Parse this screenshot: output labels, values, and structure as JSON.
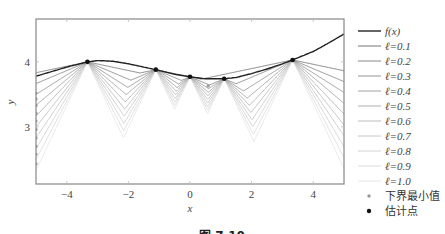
{
  "chart_data": {
    "type": "line",
    "title": "",
    "xlabel": "x",
    "ylabel": "y",
    "xlim": [
      -5,
      5
    ],
    "ylim": [
      2.12,
      4.66
    ],
    "xticks": [
      -4,
      -2,
      0,
      2,
      4
    ],
    "xtick_labels": [
      "−4",
      "−2",
      "0",
      "2",
      "4"
    ],
    "yticks": [
      3,
      4
    ],
    "ytick_labels": [
      "3",
      "4"
    ],
    "grid": false,
    "legend_position": "right",
    "f": {
      "name": "f(x)",
      "color": "#222222",
      "x": [
        -5,
        -4.5,
        -4,
        -3.33,
        -3,
        -2.5,
        -2,
        -1.5,
        -1.11,
        -0.5,
        0,
        0.5,
        1.11,
        1.5,
        2,
        2.5,
        3,
        3.33,
        4,
        4.5,
        5
      ],
      "y": [
        3.78,
        3.85,
        3.92,
        4.0,
        4.02,
        4.01,
        3.97,
        3.92,
        3.88,
        3.81,
        3.77,
        3.74,
        3.74,
        3.76,
        3.82,
        3.89,
        3.97,
        4.03,
        4.16,
        4.29,
        4.43
      ]
    },
    "estimate_points": {
      "name": "估计点",
      "x": [
        -3.33,
        -1.11,
        0,
        1.11,
        3.33
      ],
      "y": [
        4.0,
        3.88,
        3.77,
        3.74,
        4.03
      ]
    },
    "lipschitz_series": [
      {
        "name": "ℓ=0.1",
        "l": 0.1,
        "color": "#777777"
      },
      {
        "name": "ℓ=0.2",
        "l": 0.2,
        "color": "#888888"
      },
      {
        "name": "ℓ=0.3",
        "l": 0.3,
        "color": "#959595"
      },
      {
        "name": "ℓ=0.4",
        "l": 0.4,
        "color": "#a2a2a2"
      },
      {
        "name": "ℓ=0.5",
        "l": 0.5,
        "color": "#afafaf"
      },
      {
        "name": "ℓ=0.6",
        "l": 0.6,
        "color": "#bcbcbc"
      },
      {
        "name": "ℓ=0.7",
        "l": 0.7,
        "color": "#c8c8c8"
      },
      {
        "name": "ℓ=0.8",
        "l": 0.8,
        "color": "#d3d3d3"
      },
      {
        "name": "ℓ=0.9",
        "l": 0.9,
        "color": "#dddddd"
      },
      {
        "name": "ℓ=1.0",
        "l": 1.0,
        "color": "#e6e6e6"
      }
    ],
    "lower_bound_minimum": {
      "name": "下界最小值",
      "color": "#999999",
      "x": [
        0.59,
        -5,
        -5,
        -5,
        -5,
        -5,
        -5,
        -5,
        -5,
        -5,
        -5
      ],
      "y": [
        3.63,
        3.52,
        3.43,
        3.33,
        3.21,
        3.09,
        2.96,
        2.83,
        2.7,
        2.58,
        2.43
      ]
    }
  },
  "legend": {
    "items": [
      {
        "label": "f(x)",
        "kind": "line",
        "color": "#222222"
      },
      {
        "label": "ℓ=0.1",
        "kind": "line",
        "color": "#777777"
      },
      {
        "label": "ℓ=0.2",
        "kind": "line",
        "color": "#888888"
      },
      {
        "label": "ℓ=0.3",
        "kind": "line",
        "color": "#959595"
      },
      {
        "label": "ℓ=0.4",
        "kind": "line",
        "color": "#a2a2a2"
      },
      {
        "label": "ℓ=0.5",
        "kind": "line",
        "color": "#afafaf"
      },
      {
        "label": "ℓ=0.6",
        "kind": "line",
        "color": "#bcbcbc"
      },
      {
        "label": "ℓ=0.7",
        "kind": "line",
        "color": "#c8c8c8"
      },
      {
        "label": "ℓ=0.8",
        "kind": "line",
        "color": "#d3d3d3"
      },
      {
        "label": "ℓ=0.9",
        "kind": "line",
        "color": "#dddddd"
      },
      {
        "label": "ℓ=1.0",
        "kind": "line",
        "color": "#e6e6e6"
      },
      {
        "label": "下界最小值",
        "kind": "dot",
        "color": "#999999"
      },
      {
        "label": "估计点",
        "kind": "dot",
        "color": "#111111"
      }
    ]
  },
  "caption": {
    "text": "图 7.10"
  }
}
